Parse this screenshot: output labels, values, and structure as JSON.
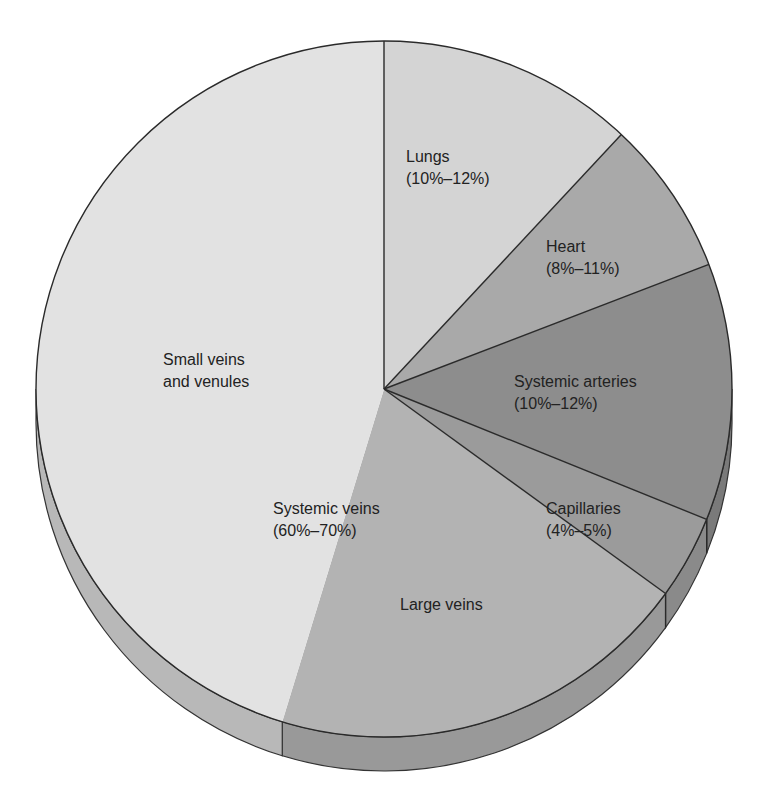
{
  "chart_data": {
    "type": "pie",
    "title": "",
    "style": "3d-pie",
    "unit": "percent of total blood volume",
    "slices": [
      {
        "name": "Lungs",
        "range_label": "(10%–12%)",
        "range": [
          10,
          12
        ],
        "value": 11.9,
        "start_angle": -90,
        "end_angle": -47,
        "color": "#d4d4d4"
      },
      {
        "name": "Heart",
        "range_label": "(8%–11%)",
        "range": [
          8,
          11
        ],
        "value": 7.2,
        "start_angle": -47,
        "end_angle": -21,
        "color": "#a9a9a9"
      },
      {
        "name": "Systemic arteries",
        "range_label": "(10%–12%)",
        "range": [
          10,
          12
        ],
        "value": 11.9,
        "start_angle": -21,
        "end_angle": 22,
        "color": "#8d8d8d"
      },
      {
        "name": "Capillaries",
        "range_label": "(4%–5%)",
        "range": [
          4,
          5
        ],
        "value": 3.9,
        "start_angle": 22,
        "end_angle": 36,
        "color": "#9b9b9b"
      },
      {
        "name": "Large veins",
        "range_label": "",
        "range": null,
        "value": 19.7,
        "start_angle": 36,
        "end_angle": 107,
        "color": "#b3b3b3"
      },
      {
        "name": "Small veins and venules",
        "range_label": "",
        "range": null,
        "value": 45.3,
        "start_angle": 107,
        "end_angle": 270,
        "color": "#e2e2e2"
      }
    ],
    "groups": [
      {
        "name": "Systemic veins",
        "range_label": "(60%–70%)",
        "range": [
          60,
          70
        ],
        "members": [
          "Large veins",
          "Small veins and venules"
        ]
      }
    ],
    "legend": "none (inline labels)",
    "side_colors": {
      "Large veins": "#999999",
      "Small veins and venules": "#b8b8b8",
      "Capillaries": "#8a8a8a",
      "Systemic arteries": "#7a7a7a"
    }
  },
  "labels": {
    "lungs": {
      "name": "Lungs",
      "range": "(10%–12%)"
    },
    "heart": {
      "name": "Heart",
      "range": "(8%–11%)"
    },
    "arteries": {
      "name": "Systemic arteries",
      "range": "(10%–12%)"
    },
    "capillaries": {
      "name": "Capillaries",
      "range": "(4%–5%)"
    },
    "small_veins": {
      "line1": "Small veins",
      "line2": "and venules"
    },
    "systemic_veins": {
      "name": "Systemic veins",
      "range": "(60%–70%)"
    },
    "large_veins": {
      "name": "Large veins"
    }
  }
}
